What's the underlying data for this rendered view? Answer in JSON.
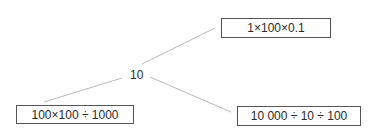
{
  "diagram": {
    "center": {
      "label": "10"
    },
    "boxes": [
      {
        "label": "1×100×0.1"
      },
      {
        "label": "100×100 ÷ 1000"
      },
      {
        "label": "10 000 ÷ 10 ÷ 100"
      }
    ]
  }
}
